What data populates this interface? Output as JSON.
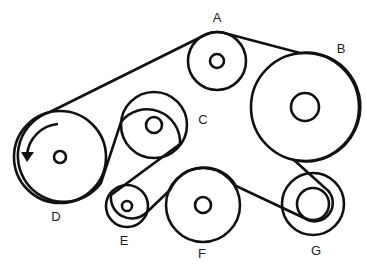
{
  "diagram": {
    "type": "serpentine-belt-routing",
    "stroke_color": "#111111",
    "background": "#ffffff",
    "rotation_arrow": "counterclockwise",
    "pulleys": [
      {
        "id": "A",
        "label": "A",
        "cx": 217,
        "cy": 61,
        "r": 29,
        "hub_r": 7,
        "label_x": 217,
        "label_y": 22
      },
      {
        "id": "B",
        "label": "B",
        "cx": 305,
        "cy": 107,
        "r": 54,
        "hub_r": 14,
        "label_x": 341,
        "label_y": 53
      },
      {
        "id": "C",
        "label": "C",
        "cx": 154,
        "cy": 125,
        "r": 33,
        "hub_r": 8,
        "label_x": 203,
        "label_y": 124
      },
      {
        "id": "D",
        "label": "D",
        "cx": 60,
        "cy": 157,
        "r": 46,
        "hub_r": 6,
        "label_x": 56,
        "label_y": 220
      },
      {
        "id": "E",
        "label": "E",
        "cx": 127,
        "cy": 206,
        "r": 21,
        "hub_r": 5,
        "label_x": 124,
        "label_y": 245
      },
      {
        "id": "F",
        "label": "F",
        "cx": 203,
        "cy": 205,
        "r": 37,
        "hub_r": 8,
        "label_x": 202,
        "label_y": 257
      },
      {
        "id": "G",
        "label": "G",
        "cx": 313,
        "cy": 204,
        "r": 31,
        "hub_r": 16,
        "label_x": 316,
        "label_y": 255
      }
    ]
  }
}
